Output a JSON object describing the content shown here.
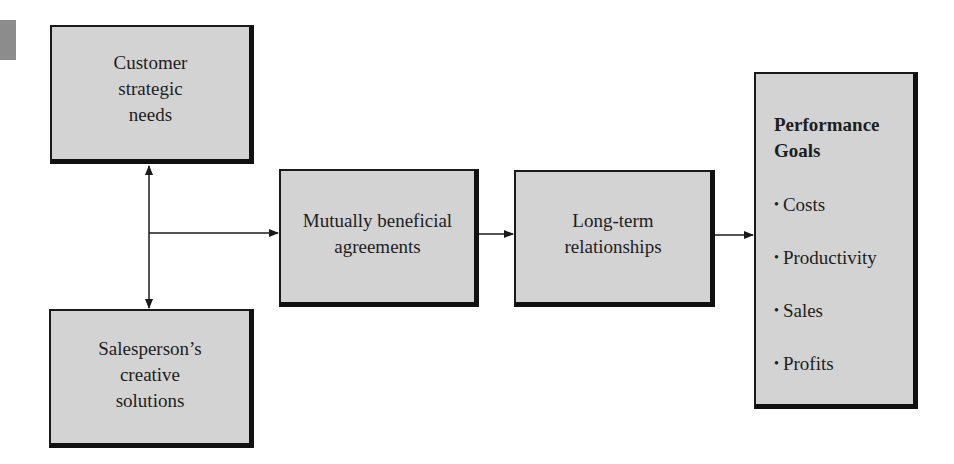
{
  "diagram": {
    "type": "flowchart",
    "nodes": {
      "customer_needs": {
        "lines": [
          "Customer",
          "strategic",
          "needs"
        ]
      },
      "salesperson_solutions": {
        "lines": [
          "Salesperson’s",
          "creative",
          "solutions"
        ]
      },
      "agreements": {
        "lines": [
          "Mutually beneficial",
          "agreements"
        ]
      },
      "relationships": {
        "lines": [
          "Long-term",
          "relationships"
        ]
      },
      "performance_goals": {
        "title_lines": [
          "Performance",
          "Goals"
        ],
        "bullet": "•",
        "items": [
          "Costs",
          "Productivity",
          "Sales",
          "Profits"
        ]
      }
    },
    "edges": [
      {
        "from": "junction",
        "to": "customer_needs",
        "direction": "up"
      },
      {
        "from": "junction",
        "to": "salesperson_solutions",
        "direction": "down"
      },
      {
        "from": "junction",
        "to": "agreements",
        "direction": "right"
      },
      {
        "from": "agreements",
        "to": "relationships",
        "direction": "right"
      },
      {
        "from": "relationships",
        "to": "performance_goals",
        "direction": "right"
      }
    ],
    "colors": {
      "box_fill": "#d3d3d3",
      "box_border": "#111111",
      "line": "#1a1a1a",
      "background": "#ffffff",
      "margin_tab": "#8c8c8c"
    }
  }
}
